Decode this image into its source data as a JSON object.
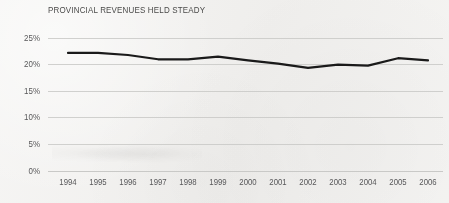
{
  "chart_data": {
    "type": "line",
    "title": "PROVINCIAL REVENUES HELD STEADY",
    "xlabel": "",
    "ylabel": "",
    "x": [
      1994,
      1995,
      1996,
      1997,
      1998,
      1999,
      2000,
      2001,
      2002,
      2003,
      2004,
      2005,
      2006
    ],
    "categories": [
      "1994",
      "1995",
      "1996",
      "1997",
      "1998",
      "1999",
      "2000",
      "2001",
      "2002",
      "2003",
      "2004",
      "2005",
      "2006"
    ],
    "series": [
      {
        "name": "Provincial revenues",
        "values": [
          22.2,
          22.2,
          21.8,
          21.0,
          21.0,
          21.5,
          20.8,
          20.2,
          19.4,
          20.0,
          19.8,
          21.2,
          20.8
        ],
        "color": "#1a1a1a"
      }
    ],
    "ylim": [
      0,
      25
    ],
    "ytick_values": [
      0,
      5,
      10,
      15,
      20,
      25
    ],
    "ytick_labels": [
      "0%",
      "5%",
      "10%",
      "15%",
      "20%",
      "25%"
    ],
    "grid": true,
    "grid_axis": "y",
    "grid_color": "#c9c9c7",
    "legend": false,
    "legend_position": "none",
    "background_color": "#f2f1ef",
    "title_color": "#4a4a49",
    "tick_color": "#58585a",
    "line_width": 2.2
  },
  "meta": {
    "title_text": "PROVINCIAL REVENUES HELD STEADY"
  }
}
